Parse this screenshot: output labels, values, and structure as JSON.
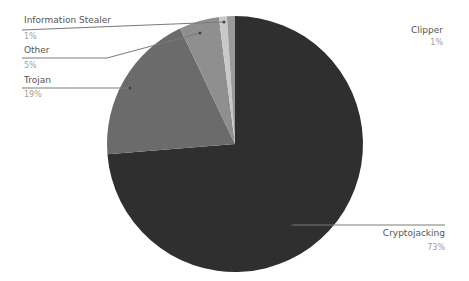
{
  "chart_data": {
    "type": "pie",
    "title": "",
    "start_angle_deg": 0,
    "direction": "clockwise",
    "legend": "none (leader-line labels)",
    "slices": [
      {
        "label": "Cryptojacking",
        "value": 73,
        "pct_label": "73%",
        "color": "#2f2f2f"
      },
      {
        "label": "Trojan",
        "value": 19,
        "pct_label": "19%",
        "color": "#6b6b6b"
      },
      {
        "label": "Other",
        "value": 5,
        "pct_label": "5%",
        "color": "#8f8f8f"
      },
      {
        "label": "Information Stealer",
        "value": 1,
        "pct_label": "1%",
        "color": "#c9c9c9"
      },
      {
        "label": "Clipper",
        "value": 1,
        "pct_label": "1%",
        "color": "#9a9a9a"
      }
    ]
  },
  "labels": {
    "info_stealer": {
      "name": "Information Stealer",
      "pct": "1%"
    },
    "other": {
      "name": "Other",
      "pct": "5%"
    },
    "trojan": {
      "name": "Trojan",
      "pct": "19%"
    },
    "clipper": {
      "name": "Clipper",
      "pct": "1%"
    },
    "cryptojacking": {
      "name": "Cryptojacking",
      "pct": "73%"
    }
  }
}
